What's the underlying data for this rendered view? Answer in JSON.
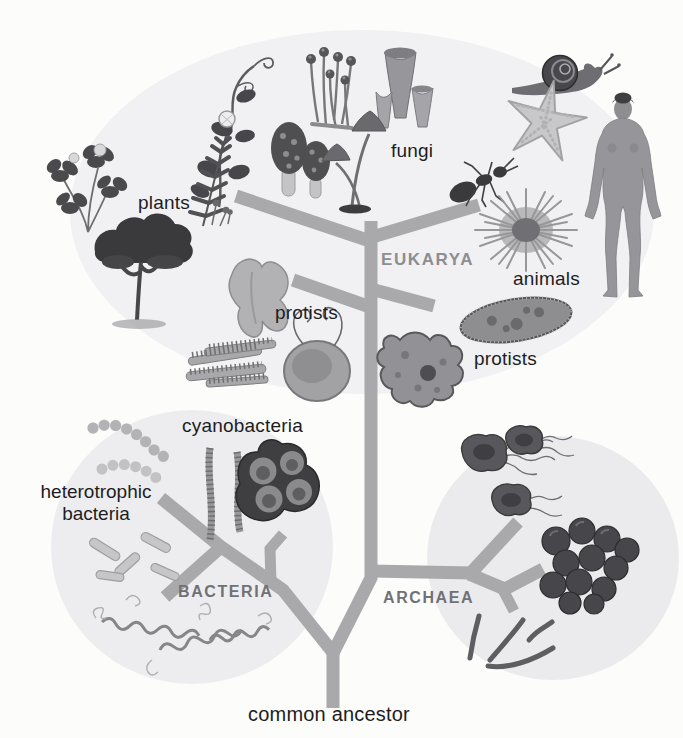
{
  "figure": {
    "type": "phylogenetic-tree-diagram",
    "root_label": "common ancestor",
    "domain_labels": {
      "eukarya": "EUKARYA",
      "bacteria": "BACTERIA",
      "archaea": "ARCHAEA"
    },
    "group_labels": {
      "plants": "plants",
      "fungi": "fungi",
      "animals": "animals",
      "protists_left": "protists",
      "protists_right": "protists",
      "cyanobacteria": "cyanobacteria",
      "heterotrophic_line1": "heterotrophic",
      "heterotrophic_line2": "bacteria"
    },
    "tree": {
      "root": "common ancestor",
      "domains": [
        {
          "name": "BACTERIA",
          "members": [
            "heterotrophic bacteria",
            "cyanobacteria"
          ]
        },
        {
          "name": "ARCHAEA",
          "members": []
        },
        {
          "name": "EUKARYA",
          "members": [
            "protists",
            "protists",
            "plants",
            "fungi",
            "animals"
          ]
        }
      ]
    },
    "colors": {
      "background": "#fcfcfb",
      "branch": "#a9a9ab",
      "eukarya_label": "#8d8d92",
      "bacteria_archaea_label": "#717175",
      "text": "#1d1d1f",
      "eukarya_halo": "#f1f1f4",
      "bacteria_halo": "#ededef",
      "archaea_halo": "#ebebee"
    }
  }
}
